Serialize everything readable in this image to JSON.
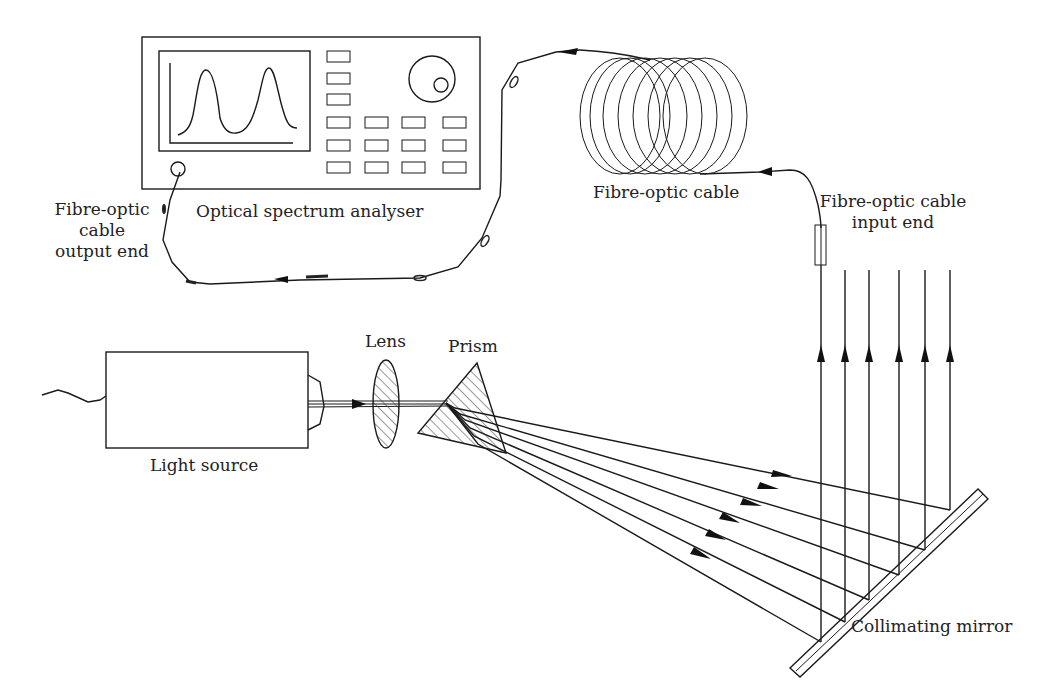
{
  "diagram": {
    "labels": {
      "osa": "Optical spectrum analyser",
      "cable_output_line1": "Fibre-optic",
      "cable_output_line2": "cable",
      "cable_output_line3": "output end",
      "fibre_cable": "Fibre-optic cable",
      "cable_input_line1": "Fibre-optic cable",
      "cable_input_line2": "input end",
      "lens": "Lens",
      "prism": "Prism",
      "light_source": "Light source",
      "mirror": "Collimating mirror"
    },
    "components": [
      {
        "id": "light-source",
        "name": "Light source"
      },
      {
        "id": "lens",
        "name": "Lens"
      },
      {
        "id": "prism",
        "name": "Prism"
      },
      {
        "id": "collimating-mirror",
        "name": "Collimating mirror"
      },
      {
        "id": "fibre-input-end",
        "name": "Fibre-optic cable input end"
      },
      {
        "id": "fibre-coil",
        "name": "Fibre-optic cable"
      },
      {
        "id": "fibre-output-end",
        "name": "Fibre-optic cable output end"
      },
      {
        "id": "optical-spectrum-analyser",
        "name": "Optical spectrum analyser"
      }
    ],
    "osa_display": {
      "peaks": 2
    },
    "collimated_beams": 6,
    "dispersed_rays": 6,
    "colors": {
      "line": "#1a1a1a",
      "background": "#ffffff",
      "text": "#222222"
    }
  }
}
